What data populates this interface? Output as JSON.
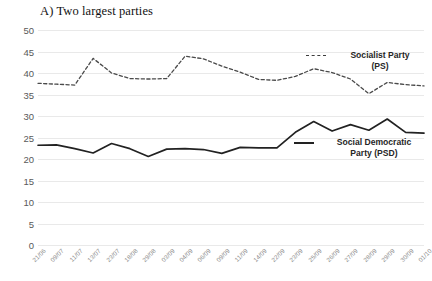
{
  "chart_data": {
    "type": "line",
    "title": "A) Two largest parties",
    "xlabel": "",
    "ylabel": "",
    "ylim": [
      0,
      50
    ],
    "ystep": 5,
    "grid": true,
    "legend_position": "inside-right",
    "yticks": [
      "50",
      "45",
      "40",
      "35",
      "30",
      "25",
      "20",
      "15",
      "10",
      "5",
      "0"
    ],
    "categories": [
      "21/06",
      "09/07",
      "11/07",
      "13/07",
      "23/07",
      "18/08",
      "29/08",
      "03/09",
      "04/09",
      "06/09",
      "09/09",
      "11/09",
      "14/09",
      "22/09",
      "23/09",
      "25/09",
      "26/09",
      "27/09",
      "28/09",
      "29/09",
      "30/09",
      "01/10"
    ],
    "series": [
      {
        "name": "Socialist Party (PS)",
        "short": "PS",
        "style": "dashed",
        "color": "#4a4a4a",
        "values": [
          37.6,
          37.4,
          37.2,
          43.4,
          40.0,
          38.7,
          38.6,
          38.7,
          43.9,
          43.3,
          41.6,
          40.2,
          38.5,
          38.3,
          39.2,
          41.0,
          40.1,
          38.6,
          35.2,
          37.8,
          37.3,
          37.0
        ]
      },
      {
        "name": "Social Democratic Party (PSD)",
        "short": "PSD",
        "style": "solid",
        "color": "#222222",
        "values": [
          23.2,
          23.3,
          22.4,
          21.4,
          23.6,
          22.4,
          20.6,
          22.3,
          22.4,
          22.2,
          21.3,
          22.7,
          22.6,
          22.6,
          26.2,
          28.7,
          26.5,
          28.0,
          26.7,
          29.3,
          26.2,
          26.0
        ]
      }
    ]
  },
  "legend": {
    "ps_line1": "Socialist Party",
    "ps_line2": "(PS)",
    "psd_line1": "Social Democratic",
    "psd_line2": "Party (PSD)"
  }
}
